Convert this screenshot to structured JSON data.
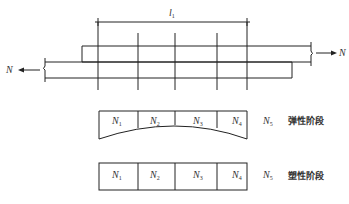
{
  "diagram": {
    "type": "lap-joint force distribution",
    "dimension_label": {
      "symbol": "l",
      "subscript": "1"
    },
    "force_left": "N",
    "force_right": "N",
    "elastic_stage": {
      "title": "弹性阶段",
      "cells": [
        {
          "symbol": "N",
          "subscript": "1"
        },
        {
          "symbol": "N",
          "subscript": "2"
        },
        {
          "symbol": "N",
          "subscript": "3"
        },
        {
          "symbol": "N",
          "subscript": "4"
        }
      ],
      "extra": {
        "symbol": "N",
        "subscript": "5"
      }
    },
    "plastic_stage": {
      "title": "塑性阶段",
      "cells": [
        {
          "symbol": "N",
          "subscript": "1"
        },
        {
          "symbol": "N",
          "subscript": "2"
        },
        {
          "symbol": "N",
          "subscript": "3"
        },
        {
          "symbol": "N",
          "subscript": "4"
        }
      ],
      "extra": {
        "symbol": "N",
        "subscript": "5"
      }
    },
    "line_color": "#222222"
  }
}
